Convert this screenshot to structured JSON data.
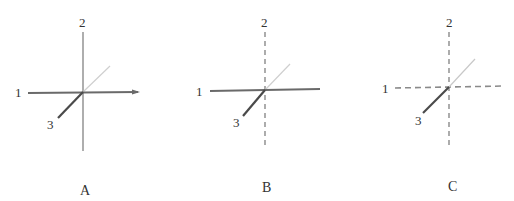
{
  "figure": {
    "colors": {
      "solid_axis": "#6a6a6a",
      "dark_axis3": "#4a4a4a",
      "light_axis3": "#c8c8c8",
      "dashed_axis": "#8a8a8a",
      "text": "#333333"
    },
    "panels": [
      {
        "caption": "A",
        "center": [
          83,
          92
        ],
        "axis_labels": {
          "axis1": "1",
          "axis2": "2",
          "axis3": "3"
        },
        "axis1_style": "solid",
        "axis2_style": "solid",
        "axis3_style": "solid"
      },
      {
        "caption": "B",
        "center": [
          265,
          90
        ],
        "axis_labels": {
          "axis1": "1",
          "axis2": "2",
          "axis3": "3"
        },
        "axis1_style": "solid",
        "axis2_style": "dashed",
        "axis3_style": "solid"
      },
      {
        "caption": "C",
        "center": [
          449,
          87
        ],
        "axis_labels": {
          "axis1": "1",
          "axis2": "2",
          "axis3": "3"
        },
        "axis1_style": "dashed",
        "axis2_style": "dashed",
        "axis3_style": "solid"
      }
    ]
  }
}
